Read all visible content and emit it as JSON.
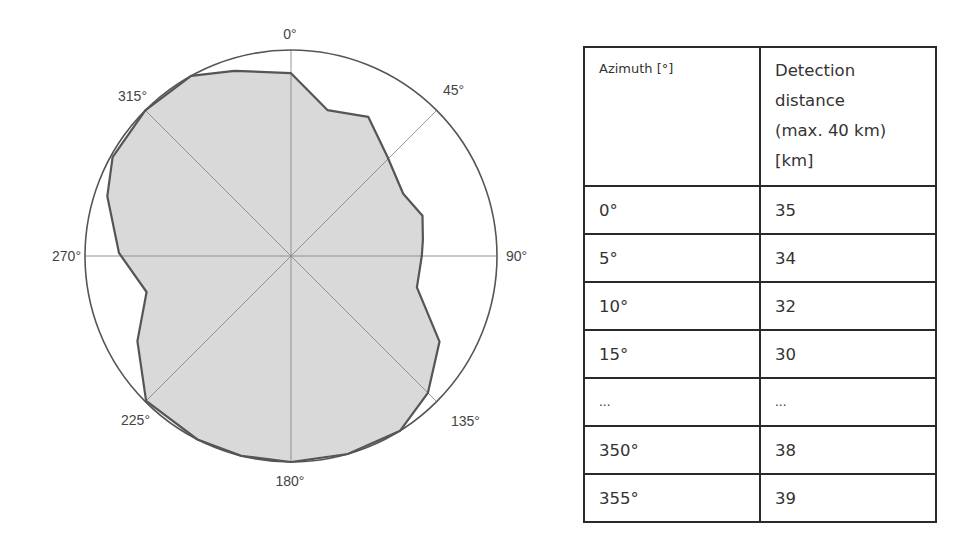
{
  "chart_data": [
    {
      "type": "polar-area",
      "title": "",
      "radial_max_km": 40,
      "angle_labels": [
        "0°",
        "45°",
        "90°",
        "135°",
        "180°",
        "225°",
        "270°",
        "315°"
      ],
      "angle_label_values": [
        0,
        45,
        90,
        135,
        180,
        225,
        270,
        315
      ],
      "grid": {
        "outer_circle": true,
        "spokes_deg": [
          0,
          45,
          90,
          135,
          180,
          225,
          270,
          315
        ]
      },
      "series": [
        {
          "name": "Detection distance [km]",
          "fill": "#d9d9d9",
          "stroke": "#555555",
          "points": [
            {
              "azimuth": 0,
              "km": 35.5
            },
            {
              "azimuth": 14,
              "km": 29.2
            },
            {
              "azimuth": 29,
              "km": 30.9
            },
            {
              "azimuth": 44,
              "km": 26.9
            },
            {
              "azimuth": 61,
              "km": 24.9
            },
            {
              "azimuth": 73,
              "km": 26.7
            },
            {
              "azimuth": 83,
              "km": 25.8
            },
            {
              "azimuth": 90,
              "km": 25.4
            },
            {
              "azimuth": 104,
              "km": 25.2
            },
            {
              "azimuth": 120,
              "km": 33.3
            },
            {
              "azimuth": 135,
              "km": 37.6
            },
            {
              "azimuth": 148,
              "km": 40
            },
            {
              "azimuth": 164,
              "km": 40
            },
            {
              "azimuth": 180,
              "km": 40
            },
            {
              "azimuth": 194,
              "km": 40
            },
            {
              "azimuth": 207,
              "km": 40
            },
            {
              "azimuth": 225,
              "km": 39.8
            },
            {
              "azimuth": 241,
              "km": 34.1
            },
            {
              "azimuth": 256,
              "km": 28.9
            },
            {
              "azimuth": 271,
              "km": 33.4
            },
            {
              "azimuth": 288,
              "km": 37.5
            },
            {
              "azimuth": 299,
              "km": 39.6
            },
            {
              "azimuth": 315,
              "km": 40
            },
            {
              "azimuth": 331,
              "km": 40
            },
            {
              "azimuth": 343,
              "km": 37.6
            }
          ]
        }
      ]
    },
    {
      "type": "table",
      "columns": [
        "Azimuth [°]",
        "Detection distance (max. 40 km) [km]"
      ],
      "rows": [
        [
          "0°",
          "35"
        ],
        [
          "5°",
          "34"
        ],
        [
          "10°",
          "32"
        ],
        [
          "15°",
          "30"
        ],
        [
          "...",
          "..."
        ],
        [
          "350°",
          "38"
        ],
        [
          "355°",
          "39"
        ]
      ]
    }
  ],
  "table": {
    "header": {
      "azimuth": "Azimuth [°]",
      "distance_lines": [
        "Detection",
        "distance",
        "(max. 40 km)",
        "[km]"
      ]
    },
    "rows": [
      {
        "azimuth": "0°",
        "distance": "35"
      },
      {
        "azimuth": "5°",
        "distance": "34"
      },
      {
        "azimuth": "10°",
        "distance": "32"
      },
      {
        "azimuth": "15°",
        "distance": "30"
      },
      {
        "azimuth": "...",
        "distance": "..."
      },
      {
        "azimuth": "350°",
        "distance": "38"
      },
      {
        "azimuth": "355°",
        "distance": "39"
      }
    ]
  },
  "colors": {
    "fill": "#d9d9d9",
    "outline": "#555555",
    "grid": "#888888",
    "circle": "#555555",
    "table_border": "#2a2a2a"
  }
}
